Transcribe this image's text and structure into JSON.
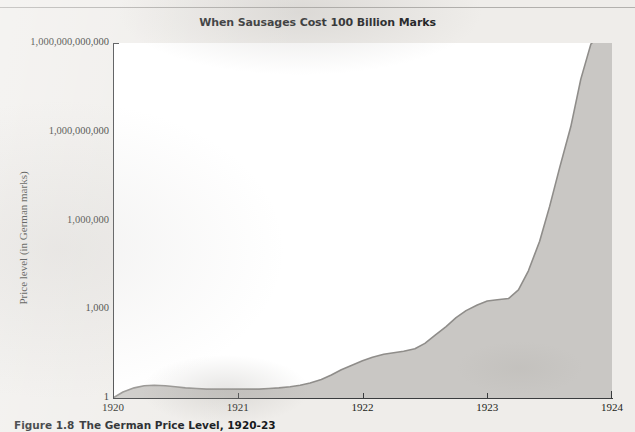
{
  "figure": {
    "title": "When Sausages Cost 100 Billion Marks",
    "caption_number": "Figure 1.8",
    "caption_text": "The German Price Level, 1920-23"
  },
  "colors": {
    "area_fill": "#c9c7c4",
    "area_stroke": "#8f8d8a",
    "axis": "#3a3c3e",
    "plot_background": "#ffffff",
    "page_background": "#efedea",
    "text": "#1c1e20"
  },
  "chart_data": {
    "type": "area",
    "title": "When Sausages Cost 100 Billion Marks",
    "xlabel": "",
    "ylabel": "Price level (in German marks)",
    "yscale": "log",
    "ylim": [
      1,
      1000000000000
    ],
    "xlim": [
      1920,
      1924
    ],
    "grid": false,
    "legend": null,
    "ytick_labels": [
      "1,000,000,000,000",
      "1,000,000,000",
      "1,000,000",
      "1,000",
      "1"
    ],
    "ytick_values": [
      1000000000000,
      1000000000,
      1000000,
      1000,
      1
    ],
    "xtick_labels": [
      "1920",
      "1921",
      "1922",
      "1923",
      "1924"
    ],
    "xtick_values": [
      1920,
      1921,
      1922,
      1923,
      1924
    ],
    "series": [
      {
        "name": "German price level",
        "x": [
          1920.0,
          1920.08,
          1920.17,
          1920.25,
          1920.33,
          1920.42,
          1920.5,
          1920.58,
          1920.67,
          1920.75,
          1920.83,
          1920.92,
          1921.0,
          1921.08,
          1921.17,
          1921.25,
          1921.33,
          1921.42,
          1921.5,
          1921.58,
          1921.67,
          1921.75,
          1921.83,
          1921.92,
          1922.0,
          1922.08,
          1922.17,
          1922.25,
          1922.33,
          1922.42,
          1922.5,
          1922.58,
          1922.67,
          1922.75,
          1922.83,
          1922.92,
          1923.0,
          1923.08,
          1923.17,
          1923.25,
          1923.33,
          1923.42,
          1923.5,
          1923.58,
          1923.67,
          1923.75,
          1923.83,
          1923.92,
          1924.0
        ],
        "y": [
          1.0,
          1.6,
          2.2,
          2.6,
          2.7,
          2.6,
          2.4,
          2.2,
          2.1,
          2.0,
          2.0,
          2.0,
          2.0,
          2.0,
          2.0,
          2.1,
          2.2,
          2.4,
          2.7,
          3.2,
          4.2,
          6.0,
          9.0,
          13.0,
          18.0,
          24.0,
          30.0,
          34.0,
          38.0,
          46.0,
          70.0,
          130.0,
          260.0,
          520.0,
          900.0,
          1400.0,
          1900.0,
          2100.0,
          2300.0,
          4500.0,
          20000.0,
          200000.0,
          3000000.0,
          60000000.0,
          1500000000.0,
          60000000000.0,
          900000000000.0,
          2500000000000.0,
          2600000000000.0
        ]
      }
    ],
    "annotations": []
  }
}
